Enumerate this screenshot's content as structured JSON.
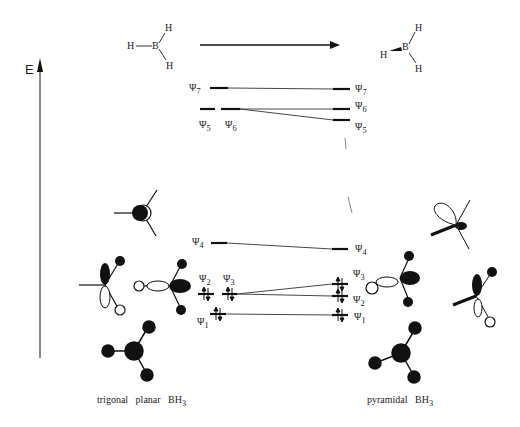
{
  "diagram": {
    "axis": {
      "label": "E"
    },
    "top_structures": {
      "left": {
        "atoms": [
          "H",
          "B",
          "H",
          "H"
        ],
        "name": "planar-BH3"
      },
      "right": {
        "atoms": [
          "H",
          "B",
          "H",
          "H"
        ],
        "name": "pyramidal-BH3"
      }
    },
    "left_levels": [
      {
        "label": "Ψ7",
        "psi": "Ψ",
        "sub": "7"
      },
      {
        "label": "Ψ5",
        "psi": "Ψ",
        "sub": "5"
      },
      {
        "label": "Ψ6",
        "psi": "Ψ",
        "sub": "6"
      },
      {
        "label": "Ψ4",
        "psi": "Ψ",
        "sub": "4"
      },
      {
        "label": "Ψ2",
        "psi": "Ψ",
        "sub": "2"
      },
      {
        "label": "Ψ3",
        "psi": "Ψ",
        "sub": "3"
      },
      {
        "label": "Ψ1",
        "psi": "Ψ",
        "sub": "1"
      }
    ],
    "right_levels": [
      {
        "label": "Ψ7",
        "psi": "Ψ",
        "sub": "7"
      },
      {
        "label": "Ψ6",
        "psi": "Ψ",
        "sub": "6"
      },
      {
        "label": "Ψ5",
        "psi": "Ψ",
        "sub": "5"
      },
      {
        "label": "Ψ4",
        "psi": "Ψ",
        "sub": "4"
      },
      {
        "label": "Ψ3",
        "psi": "Ψ",
        "sub": "3"
      },
      {
        "label": "Ψ2",
        "psi": "Ψ",
        "sub": "2"
      },
      {
        "label": "Ψ1",
        "psi": "Ψ",
        "sub": "1"
      }
    ],
    "captions": {
      "left": "trigonal planar BH",
      "left_sub": "3",
      "right": "pyramidal BH",
      "right_sub": "3"
    }
  }
}
